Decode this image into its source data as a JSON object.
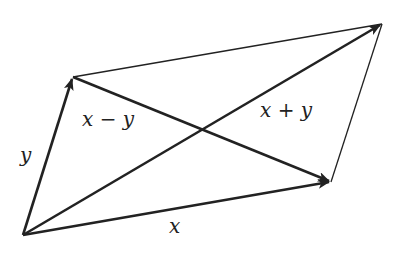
{
  "diagram": {
    "stroke_color": "#222222",
    "background": "#ffffff",
    "vertices": {
      "origin": [
        23,
        235
      ],
      "y_tip": [
        73,
        77
      ],
      "x_tip": [
        331,
        182
      ],
      "sum_tip": [
        382,
        24
      ]
    },
    "labels": {
      "x": "x",
      "y": "y",
      "diff": "x − y",
      "sum": "x + y"
    }
  }
}
